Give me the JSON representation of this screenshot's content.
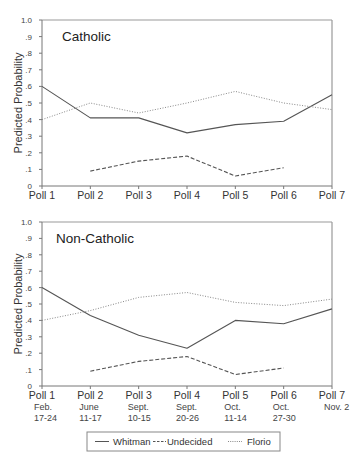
{
  "chart_data": [
    {
      "type": "line",
      "title": "Catholic",
      "xlabel": "",
      "ylabel": "Predicted Probability",
      "ylim": [
        0,
        1.0
      ],
      "yticks": [
        "0",
        ".1",
        ".2",
        ".3",
        ".4",
        ".5",
        ".6",
        ".7",
        ".8",
        ".9",
        "1.0"
      ],
      "categories": [
        "Poll 1",
        "Poll 2",
        "Poll 3",
        "Poll 4",
        "Poll 5",
        "Poll 6",
        "Poll 7"
      ],
      "series": [
        {
          "name": "Whitman",
          "style": "solid",
          "values": [
            0.6,
            0.41,
            0.41,
            0.32,
            0.37,
            0.39,
            0.55
          ]
        },
        {
          "name": "Undecided",
          "style": "dashed",
          "values": [
            null,
            0.09,
            0.15,
            0.18,
            0.06,
            0.11,
            null
          ]
        },
        {
          "name": "Florio",
          "style": "dotted",
          "values": [
            0.4,
            0.5,
            0.44,
            0.5,
            0.57,
            0.5,
            0.46
          ]
        }
      ]
    },
    {
      "type": "line",
      "title": "Non-Catholic",
      "xlabel": "",
      "ylabel": "Predicted Probability",
      "ylim": [
        0,
        1.0
      ],
      "yticks": [
        "0",
        ".1",
        ".2",
        ".3",
        ".4",
        ".5",
        ".6",
        ".7",
        ".8",
        ".9",
        "1.0"
      ],
      "categories": [
        "Poll 1",
        "Poll 2",
        "Poll 3",
        "Poll 4",
        "Poll 5",
        "Poll 6",
        "Poll 7"
      ],
      "dates": [
        [
          "Feb.",
          "17-24"
        ],
        [
          "June",
          "11-17"
        ],
        [
          "Sept.",
          "10-15"
        ],
        [
          "Sept.",
          "20-26"
        ],
        [
          "Oct.",
          "11-14"
        ],
        [
          "Oct.",
          "27-30"
        ],
        [
          "Nov. 2",
          ""
        ]
      ],
      "series": [
        {
          "name": "Whitman",
          "style": "solid",
          "values": [
            0.6,
            0.43,
            0.31,
            0.23,
            0.4,
            0.38,
            0.47
          ]
        },
        {
          "name": "Undecided",
          "style": "dashed",
          "values": [
            null,
            0.09,
            0.15,
            0.18,
            0.07,
            0.11,
            null
          ]
        },
        {
          "name": "Florio",
          "style": "dotted",
          "values": [
            0.4,
            0.46,
            0.54,
            0.57,
            0.51,
            0.49,
            0.53
          ]
        }
      ]
    }
  ],
  "legend": {
    "position": "bottom-center",
    "items": [
      {
        "label": "Whitman",
        "style": "solid"
      },
      {
        "label": "Undecided",
        "style": "dashed"
      },
      {
        "label": "Florio",
        "style": "dotted"
      }
    ]
  },
  "colors": {
    "line": "#555555",
    "axis": "#777777",
    "frame": "#999999"
  }
}
